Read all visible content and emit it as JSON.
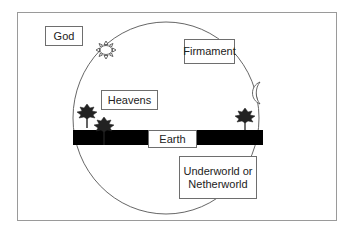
{
  "diagram": {
    "type": "cosmology",
    "labels": {
      "god": "God",
      "firmament": "Firmament",
      "heavens": "Heavens",
      "earth": "Earth",
      "underworld_line1": "Underworld or",
      "underworld_line2": "Netherworld"
    },
    "icons": [
      "sun-icon",
      "moon-icon",
      "tree-icon",
      "tree-icon",
      "tree-icon"
    ],
    "colors": {
      "frame": "#9a9a9a",
      "circle": "#555555",
      "earth_band": "#000000",
      "box_border": "#6e6e6e",
      "text": "#222222"
    }
  }
}
